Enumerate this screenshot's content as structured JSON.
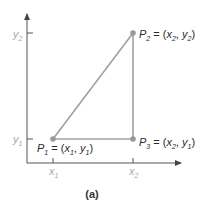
{
  "diagram": {
    "caption": "(a)",
    "colors": {
      "axis": "#555555",
      "segment": "#a0a0a0",
      "point": "#999999",
      "label": "#2b2b2b",
      "tick_label": "#a8a8a8"
    },
    "axes": {
      "x_ticks": [
        {
          "base": "x",
          "sub": "1"
        },
        {
          "base": "x",
          "sub": "2"
        }
      ],
      "y_ticks": [
        {
          "base": "y",
          "sub": "1"
        },
        {
          "base": "y",
          "sub": "2"
        }
      ]
    },
    "points": [
      {
        "name": "P1",
        "label_base": "P",
        "label_sub": "1",
        "eq": " = (",
        "x_base": "x",
        "x_sub": "1",
        "sep": ", ",
        "y_base": "y",
        "y_sub": "1",
        "close": ")"
      },
      {
        "name": "P2",
        "label_base": "P",
        "label_sub": "2",
        "eq": " = (",
        "x_base": "x",
        "x_sub": "2",
        "sep": ", ",
        "y_base": "y",
        "y_sub": "2",
        "close": ")"
      },
      {
        "name": "P3",
        "label_base": "P",
        "label_sub": "3",
        "eq": " = (",
        "x_base": "x",
        "x_sub": "2",
        "sep": ", ",
        "y_base": "y",
        "y_sub": "1",
        "close": ")"
      }
    ]
  }
}
